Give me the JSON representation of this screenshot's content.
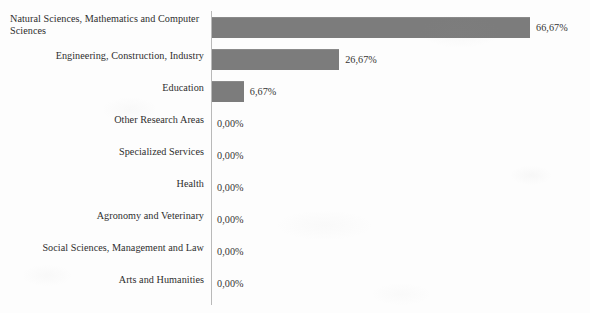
{
  "chart_data": {
    "type": "bar",
    "orientation": "horizontal",
    "title": "",
    "subtitle": "",
    "xlabel": "",
    "ylabel": "",
    "xlim": [
      0,
      66.67
    ],
    "grid": false,
    "legend": false,
    "decimal_separator": ",",
    "value_suffix": "%",
    "bar_color": "#7c7c7c",
    "axis_color": "#b9b9b9",
    "background_color": "#fdfdfd",
    "text_color": "#2e2e2e",
    "categories": [
      "Natural Sciences, Mathematics and Computer Sciences",
      "Engineering, Construction, Industry",
      "Education",
      "Other Research Areas",
      "Specialized Services",
      "Health",
      "Agronomy and Veterinary",
      "Social Sciences, Management and Law",
      "Arts and Humanities"
    ],
    "values": [
      66.67,
      26.67,
      6.67,
      0.0,
      0.0,
      0.0,
      0.0,
      0.0,
      0.0
    ],
    "value_labels": [
      "66,67%",
      "26,67%",
      "6,67%",
      "0,00%",
      "0,00%",
      "0,00%",
      "0,00%",
      "0,00%",
      "0,00%"
    ]
  },
  "rows": [
    {
      "label": "Natural Sciences, Mathematics and Computer Sciences",
      "value_label": "66,67%",
      "value": 66.67
    },
    {
      "label": "Engineering, Construction, Industry",
      "value_label": "26,67%",
      "value": 26.67
    },
    {
      "label": "Education",
      "value_label": "6,67%",
      "value": 6.67
    },
    {
      "label": "Other Research Areas",
      "value_label": "0,00%",
      "value": 0
    },
    {
      "label": "Specialized Services",
      "value_label": "0,00%",
      "value": 0
    },
    {
      "label": "Health",
      "value_label": "0,00%",
      "value": 0
    },
    {
      "label": "Agronomy and Veterinary",
      "value_label": "0,00%",
      "value": 0
    },
    {
      "label": "Social Sciences, Management and Law",
      "value_label": "0,00%",
      "value": 0
    },
    {
      "label": "Arts and Humanities",
      "value_label": "0,00%",
      "value": 0
    }
  ]
}
